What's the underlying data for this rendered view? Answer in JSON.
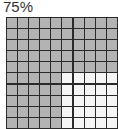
{
  "chart_data": {
    "type": "waffle",
    "title": "75%",
    "rows": 10,
    "columns": 10,
    "filled": 75,
    "total": 100,
    "fill_order": "rows 1-5 fully filled; rows 6-10 columns 1-5 filled",
    "colors": {
      "filled": "#b3b3b3",
      "empty": "#f5f5f5",
      "gridline": "#2a2a2a"
    }
  }
}
